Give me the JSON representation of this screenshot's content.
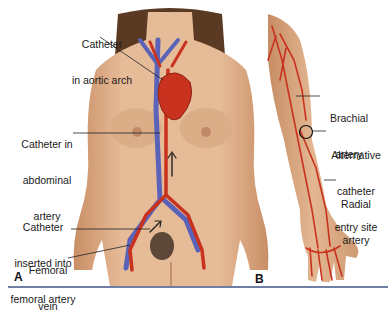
{
  "figure": {
    "panel_a": {
      "letter": "A",
      "labels": [
        {
          "id": "aortic-arch",
          "line1": "Catheter",
          "line2": "in aortic arch"
        },
        {
          "id": "abdominal-artery",
          "line1": "Catheter in",
          "line2": "abdominal",
          "line3": "artery"
        },
        {
          "id": "femoral-artery",
          "line1": "Catheter",
          "line2": "inserted into",
          "line3": "femoral artery"
        },
        {
          "id": "femoral-vein",
          "line1": "Femoral",
          "line2": "vein"
        }
      ]
    },
    "panel_b": {
      "letter": "B",
      "labels": [
        {
          "id": "brachial-artery",
          "line1": "Brachial",
          "line2": "artery"
        },
        {
          "id": "alternative-entry",
          "line1": "Alternative",
          "line2": "catheter",
          "line3": "entry site"
        },
        {
          "id": "radial-artery",
          "line1": "Radial",
          "line2": "artery"
        }
      ]
    },
    "colors": {
      "skin": "#e2b48e",
      "skin_shadow": "#c98f66",
      "hair": "#5a3a22",
      "artery": "#c8321e",
      "vein": "#5b63b8",
      "rule": "#6f7fa3"
    }
  }
}
